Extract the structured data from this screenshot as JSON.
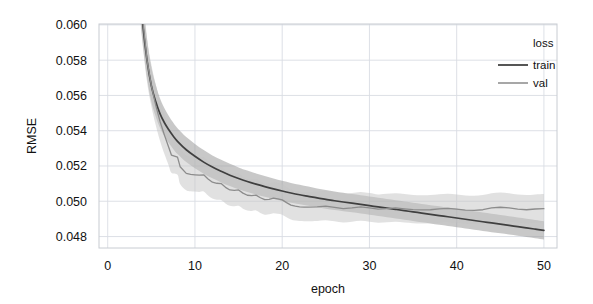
{
  "chart_data": {
    "type": "line",
    "title": "",
    "xlabel": "epoch",
    "ylabel": "RMSE",
    "xlim": [
      -1.0,
      51.5
    ],
    "ylim": [
      0.04735,
      0.06005
    ],
    "xticks": [
      0,
      10,
      20,
      30,
      40,
      50
    ],
    "xtick_labels": [
      "0",
      "10",
      "20",
      "30",
      "40",
      "50"
    ],
    "yticks": [
      0.048,
      0.05,
      0.052,
      0.054,
      0.056,
      0.058,
      0.06
    ],
    "ytick_labels": [
      "0.048",
      "0.050",
      "0.052",
      "0.054",
      "0.056",
      "0.058",
      "0.060"
    ],
    "grid": true,
    "grid_color": "#d9dde3",
    "legend": {
      "title": "loss",
      "position": "upper right",
      "entries": [
        {
          "label": "train",
          "color": "#4d4d4d"
        },
        {
          "label": "val",
          "color": "#8a8a8a"
        }
      ]
    },
    "series": [
      {
        "name": "train",
        "color": "#3f3f3f",
        "band_color": "#9a9a9a",
        "band_opacity": 0.55,
        "x": [
          3.6,
          4,
          4.5,
          5,
          5.5,
          6,
          6.5,
          7,
          7.5,
          8,
          9,
          10,
          11,
          12,
          13,
          14,
          15,
          16,
          17,
          18,
          19,
          20,
          21,
          22,
          23,
          24,
          25,
          26,
          27,
          28,
          29,
          30,
          31,
          32,
          33,
          34,
          35,
          36,
          37,
          38,
          39,
          40,
          41,
          42,
          43,
          44,
          45,
          46,
          47,
          48,
          49,
          50
        ],
        "y": [
          0.0625,
          0.0601,
          0.058,
          0.05655,
          0.05565,
          0.05495,
          0.05445,
          0.05405,
          0.0537,
          0.0534,
          0.05292,
          0.05255,
          0.05222,
          0.05194,
          0.0517,
          0.05148,
          0.05129,
          0.05112,
          0.05097,
          0.05083,
          0.0507,
          0.05058,
          0.05047,
          0.05037,
          0.05028,
          0.05019,
          0.05011,
          0.05003,
          0.04996,
          0.04989,
          0.04982,
          0.04975,
          0.04968,
          0.04961,
          0.04954,
          0.04947,
          0.0494,
          0.04933,
          0.04926,
          0.04919,
          0.04912,
          0.04905,
          0.04898,
          0.04891,
          0.04884,
          0.04877,
          0.0487,
          0.04863,
          0.04856,
          0.04849,
          0.04842,
          0.04835
        ],
        "y_lower": [
          0.0612,
          0.059,
          0.057,
          0.05565,
          0.0548,
          0.05415,
          0.05368,
          0.0533,
          0.05297,
          0.05268,
          0.05222,
          0.05187,
          0.05156,
          0.0513,
          0.05107,
          0.05086,
          0.05068,
          0.05052,
          0.05038,
          0.05025,
          0.05013,
          0.05002,
          0.04992,
          0.04983,
          0.04974,
          0.04966,
          0.04958,
          0.04951,
          0.04944,
          0.04937,
          0.0493,
          0.04923,
          0.04916,
          0.04909,
          0.04902,
          0.04895,
          0.04888,
          0.04881,
          0.04874,
          0.04867,
          0.0486,
          0.04853,
          0.04846,
          0.04839,
          0.04832,
          0.04825,
          0.04818,
          0.04811,
          0.04804,
          0.04797,
          0.0479,
          0.04783
        ],
        "y_upper": [
          0.064,
          0.0614,
          0.0592,
          0.0576,
          0.0566,
          0.05582,
          0.05527,
          0.05483,
          0.05446,
          0.05414,
          0.05364,
          0.05325,
          0.0529,
          0.0526,
          0.05235,
          0.05212,
          0.05192,
          0.05174,
          0.05158,
          0.05143,
          0.05129,
          0.05116,
          0.05104,
          0.05093,
          0.05083,
          0.05073,
          0.05064,
          0.05056,
          0.05048,
          0.05041,
          0.05034,
          0.05027,
          0.0502,
          0.05013,
          0.05006,
          0.04999,
          0.04992,
          0.04985,
          0.04978,
          0.04971,
          0.04964,
          0.04957,
          0.0495,
          0.04943,
          0.04936,
          0.04929,
          0.04922,
          0.04915,
          0.04908,
          0.04901,
          0.04894,
          0.04887
        ]
      },
      {
        "name": "val",
        "color": "#8c8c8c",
        "band_color": "#c4c4c4",
        "band_opacity": 0.5,
        "x": [
          3.8,
          4.5,
          5,
          5.5,
          6,
          6.5,
          7,
          7.3,
          8,
          8.3,
          9,
          9.5,
          10,
          10.5,
          11,
          11.5,
          12,
          12.5,
          13,
          13.5,
          14,
          14.5,
          15,
          15.5,
          16,
          16.5,
          17,
          17.5,
          18,
          18.5,
          19,
          19.5,
          20,
          20.5,
          21,
          21.5,
          22,
          22.5,
          23,
          24,
          25,
          26,
          27,
          28,
          29,
          30,
          31,
          32,
          33,
          34,
          35,
          36,
          37,
          38,
          39,
          40,
          41,
          42,
          43,
          44,
          45,
          46,
          47,
          48,
          49,
          50
        ],
        "y": [
          0.0613,
          0.058,
          0.05655,
          0.05545,
          0.05452,
          0.05375,
          0.05305,
          0.05262,
          0.0525,
          0.05196,
          0.05158,
          0.05152,
          0.0515,
          0.05148,
          0.0515,
          0.05126,
          0.05108,
          0.05102,
          0.051,
          0.05079,
          0.05064,
          0.05062,
          0.05064,
          0.05046,
          0.05034,
          0.05032,
          0.05035,
          0.0502,
          0.05009,
          0.05011,
          0.05018,
          0.05014,
          0.05008,
          0.04992,
          0.04978,
          0.04972,
          0.04968,
          0.04967,
          0.04967,
          0.04968,
          0.04972,
          0.04965,
          0.04958,
          0.04962,
          0.04968,
          0.04962,
          0.04955,
          0.04958,
          0.04962,
          0.04957,
          0.04953,
          0.04951,
          0.04952,
          0.04957,
          0.0496,
          0.04955,
          0.0495,
          0.04948,
          0.04952,
          0.04962,
          0.04966,
          0.04962,
          0.04955,
          0.04952,
          0.04956,
          0.04958
        ],
        "y_lower": [
          0.0598,
          0.0568,
          0.0554,
          0.05432,
          0.05342,
          0.05268,
          0.05202,
          0.05162,
          0.0515,
          0.05098,
          0.05062,
          0.05057,
          0.05055,
          0.05053,
          0.05055,
          0.05032,
          0.05015,
          0.05009,
          0.05007,
          0.04988,
          0.04974,
          0.04972,
          0.04974,
          0.04958,
          0.04947,
          0.04945,
          0.04948,
          0.04934,
          0.04924,
          0.04926,
          0.04932,
          0.04929,
          0.04924,
          0.04909,
          0.04897,
          0.04891,
          0.04888,
          0.04887,
          0.04887,
          0.04888,
          0.04892,
          0.04886,
          0.0488,
          0.04884,
          0.04889,
          0.04884,
          0.04878,
          0.04881,
          0.04884,
          0.0488,
          0.04876,
          0.04874,
          0.04875,
          0.0488,
          0.04882,
          0.04878,
          0.04874,
          0.04872,
          0.04876,
          0.04885,
          0.04888,
          0.04885,
          0.04879,
          0.04876,
          0.0488,
          0.04882
        ],
        "y_upper": [
          0.0629,
          0.0593,
          0.05775,
          0.05662,
          0.05566,
          0.05486,
          0.05412,
          0.05366,
          0.05354,
          0.05298,
          0.05258,
          0.05252,
          0.0525,
          0.05248,
          0.0525,
          0.05224,
          0.05205,
          0.05199,
          0.05197,
          0.05174,
          0.05158,
          0.05156,
          0.05158,
          0.05138,
          0.05125,
          0.05123,
          0.05126,
          0.0511,
          0.05098,
          0.051,
          0.05107,
          0.05103,
          0.05097,
          0.0508,
          0.05065,
          0.05058,
          0.05054,
          0.05053,
          0.05053,
          0.05054,
          0.05058,
          0.05051,
          0.05043,
          0.05047,
          0.05053,
          0.05047,
          0.05039,
          0.05042,
          0.05046,
          0.05041,
          0.05036,
          0.05034,
          0.05035,
          0.0504,
          0.05043,
          0.05038,
          0.05033,
          0.05031,
          0.05035,
          0.05045,
          0.05049,
          0.05045,
          0.05038,
          0.05035,
          0.05039,
          0.05041
        ]
      }
    ]
  },
  "legend": {
    "title": "loss",
    "train_label": "train",
    "val_label": "val"
  },
  "axes": {
    "x_title": "epoch",
    "y_title": "RMSE"
  }
}
